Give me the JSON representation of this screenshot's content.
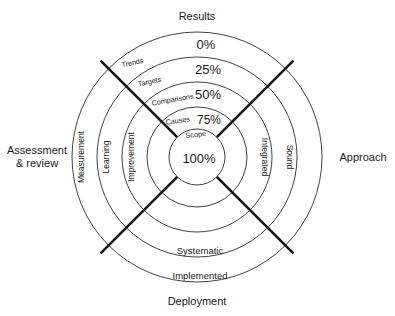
{
  "diagram": {
    "center": {
      "x": 197,
      "y": 157
    },
    "ring_radii": [
      125,
      100,
      75,
      50,
      28
    ],
    "colors": {
      "ring_stroke": "#2b2b2b",
      "axis_stroke": "#161616",
      "text": "#1a1a1a",
      "background": "#ffffff"
    },
    "outer_labels": {
      "top": "Results",
      "bottom": "Deployment",
      "left_line1": "Assessment",
      "left_line2": "& review",
      "right": "Approach"
    },
    "percent_labels": [
      {
        "value": "0%",
        "ring": 1
      },
      {
        "value": "25%",
        "ring": 2
      },
      {
        "value": "50%",
        "ring": 3
      },
      {
        "value": "75%",
        "ring": 4
      },
      {
        "value": "100%",
        "ring": 5
      }
    ],
    "bottom_band_labels": [
      {
        "value": "Systematic"
      },
      {
        "value": "Implemented"
      }
    ],
    "left_band_labels": [
      {
        "value": "Measurement"
      },
      {
        "value": "Learning"
      },
      {
        "value": "Improvement"
      }
    ],
    "right_band_labels": [
      {
        "value": "Integrated"
      },
      {
        "value": "Sound"
      }
    ],
    "diagonal_labels": [
      {
        "value": "Trends"
      },
      {
        "value": "Targets"
      },
      {
        "value": "Comparisons"
      },
      {
        "value": "Causes"
      },
      {
        "value": "Scope"
      }
    ]
  }
}
